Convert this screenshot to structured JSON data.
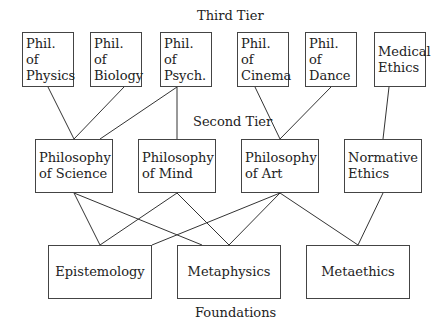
{
  "tiers": {
    "third": {
      "label": "Third Tier"
    },
    "second": {
      "label": "Second Tier"
    },
    "foundations": {
      "label": "Foundations"
    }
  },
  "nodes": {
    "phys": {
      "line1": "Phil. of",
      "line2": "Physics"
    },
    "bio": {
      "line1": "Phil. of",
      "line2": "Biology"
    },
    "psych": {
      "line1": "Phil. of",
      "line2": "Psych."
    },
    "cinema": {
      "line1": "Phil. of",
      "line2": "Cinema"
    },
    "dance": {
      "line1": "Phil. of",
      "line2": "Dance"
    },
    "medical": {
      "line1": "Medical",
      "line2": "Ethics"
    },
    "science": {
      "line1": "Philosophy",
      "line2": "of Science"
    },
    "mind": {
      "line1": "Philosophy",
      "line2": "of Mind"
    },
    "art": {
      "line1": "Philosophy",
      "line2": "of Art"
    },
    "normative": {
      "line1": "Normative",
      "line2": "Ethics"
    },
    "episte": {
      "line1": "Epistemology"
    },
    "metaph": {
      "line1": "Metaphysics"
    },
    "metaeth": {
      "line1": "Metaethics"
    }
  },
  "edges": [
    [
      "phys",
      "science"
    ],
    [
      "bio",
      "science"
    ],
    [
      "psych",
      "science"
    ],
    [
      "psych",
      "mind"
    ],
    [
      "cinema",
      "art"
    ],
    [
      "dance",
      "art"
    ],
    [
      "medical",
      "normative"
    ],
    [
      "science",
      "episte"
    ],
    [
      "science",
      "metaph"
    ],
    [
      "mind",
      "episte"
    ],
    [
      "mind",
      "metaph"
    ],
    [
      "art",
      "episte"
    ],
    [
      "art",
      "metaph"
    ],
    [
      "art",
      "metaeth"
    ],
    [
      "normative",
      "metaeth"
    ]
  ]
}
